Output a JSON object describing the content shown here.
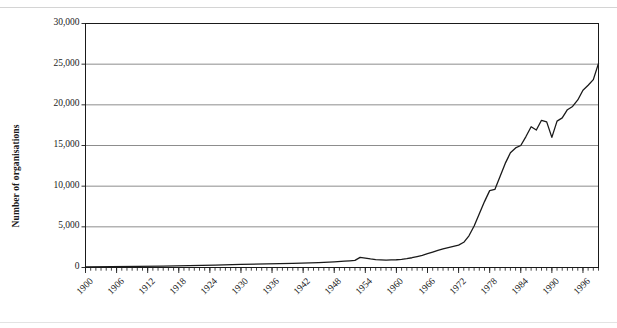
{
  "chart_data": {
    "type": "line",
    "title": "",
    "xlabel": "",
    "ylabel": "Number of organisations",
    "ylim": [
      0,
      30000
    ],
    "yticks": [
      0,
      5000,
      10000,
      15000,
      20000,
      25000,
      30000
    ],
    "ytick_labels": [
      "0",
      "5,000",
      "10,000",
      "15,000",
      "20,000",
      "25,000",
      "30,000"
    ],
    "xlim": [
      1900,
      1999
    ],
    "xtick_labels": [
      "1900",
      "1906",
      "1912",
      "1918",
      "1924",
      "1930",
      "1936",
      "1942",
      "1948",
      "1954",
      "1960",
      "1966",
      "1972",
      "1978",
      "1984",
      "1990",
      "1996"
    ],
    "xticks": [
      1900,
      1906,
      1912,
      1918,
      1924,
      1930,
      1936,
      1942,
      1948,
      1954,
      1960,
      1966,
      1972,
      1978,
      1984,
      1990,
      1996
    ],
    "minor_xtick_step": 1,
    "grid": "horizontal",
    "legend": "none",
    "line_color": "#1a1a1a",
    "grid_color": "#808080",
    "axis_color": "#1a1a1a",
    "series": [
      {
        "name": "Number of organisations",
        "x": [
          1900,
          1905,
          1910,
          1915,
          1920,
          1925,
          1930,
          1935,
          1940,
          1945,
          1948,
          1950,
          1951,
          1952,
          1953,
          1954,
          1955,
          1956,
          1957,
          1958,
          1959,
          1960,
          1961,
          1962,
          1963,
          1964,
          1965,
          1966,
          1967,
          1968,
          1969,
          1970,
          1971,
          1972,
          1973,
          1974,
          1975,
          1976,
          1977,
          1978,
          1979,
          1980,
          1981,
          1982,
          1983,
          1984,
          1985,
          1986,
          1987,
          1988,
          1989,
          1990,
          1991,
          1992,
          1993,
          1994,
          1995,
          1996,
          1997,
          1998,
          1999
        ],
        "y": [
          60,
          90,
          130,
          170,
          230,
          300,
          380,
          450,
          500,
          600,
          700,
          780,
          820,
          870,
          1250,
          1150,
          1050,
          980,
          940,
          900,
          930,
          950,
          1000,
          1080,
          1200,
          1350,
          1500,
          1700,
          1900,
          2100,
          2300,
          2450,
          2600,
          2750,
          3100,
          3900,
          5100,
          6600,
          8100,
          9450,
          9600,
          11200,
          12800,
          14100,
          14700,
          15000,
          16100,
          17300,
          16900,
          18100,
          17900,
          16000,
          18000,
          18400,
          19400,
          19800,
          20600,
          21800,
          22400,
          23100,
          25100
        ]
      }
    ]
  }
}
